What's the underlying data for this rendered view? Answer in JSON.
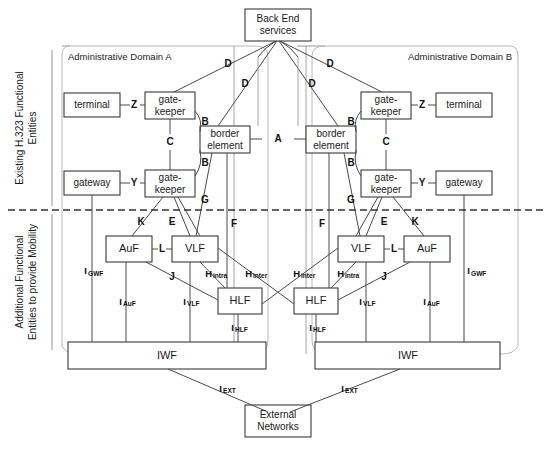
{
  "figure": {
    "divider_note": "dashed horizontal divider separating existing H.323 entities from additional mobility entities"
  },
  "side_labels": {
    "top": [
      "Existing H.323 Functional",
      "Entities"
    ],
    "bottom": [
      "Additional Functional",
      "Entities to provide Mobility"
    ]
  },
  "domains": {
    "left": {
      "title": "Administrative Domain A"
    },
    "right": {
      "title": "Administrative Domain B"
    }
  },
  "nodes": {
    "backend": {
      "lines": [
        "Back End",
        "services"
      ]
    },
    "external": {
      "lines": [
        "External",
        "Networks"
      ]
    },
    "left": {
      "terminal": {
        "label": "terminal"
      },
      "gateway": {
        "label": "gateway"
      },
      "gatekeeper_top": {
        "lines": [
          "gate-",
          "keeper"
        ]
      },
      "gatekeeper_bottom": {
        "lines": [
          "gate-",
          "keeper"
        ]
      },
      "border_element": {
        "lines": [
          "border",
          "element"
        ]
      },
      "auf": {
        "label": "AuF"
      },
      "vlf": {
        "label": "VLF"
      },
      "hlf": {
        "label": "HLF"
      },
      "iwf": {
        "label": "IWF"
      }
    },
    "right": {
      "terminal": {
        "label": "terminal"
      },
      "gateway": {
        "label": "gateway"
      },
      "gatekeeper_top": {
        "lines": [
          "gate-",
          "keeper"
        ]
      },
      "gatekeeper_bottom": {
        "lines": [
          "gate-",
          "keeper"
        ]
      },
      "border_element": {
        "lines": [
          "border",
          "element"
        ]
      },
      "auf": {
        "label": "AuF"
      },
      "vlf": {
        "label": "VLF"
      },
      "hlf": {
        "label": "HLF"
      },
      "iwf": {
        "label": "IWF"
      }
    }
  },
  "interfaces": {
    "A": "A",
    "B": "B",
    "C": "C",
    "D": "D",
    "E": "E",
    "F": "F",
    "G": "G",
    "J": "J",
    "K": "K",
    "L": "L",
    "Y": "Y",
    "Z": "Z",
    "H_intra": {
      "main": "H",
      "sub": "intra"
    },
    "H_inter": {
      "main": "H",
      "sub": "inter"
    },
    "I_GWF": {
      "main": "I",
      "sub": "GWF"
    },
    "I_AuF": {
      "main": "I",
      "sub": "AuF"
    },
    "I_VLF": {
      "main": "I",
      "sub": "VLF"
    },
    "I_HLF": {
      "main": "I",
      "sub": "HLF"
    },
    "I_EXT": {
      "main": "I",
      "sub": "EXT"
    }
  },
  "colors": {
    "box_stroke": "#3a3a3a",
    "link": "#4a4a4a",
    "domain_outline": "#b8b8b8",
    "divider": "#333333",
    "text": "#1a1a1a"
  }
}
